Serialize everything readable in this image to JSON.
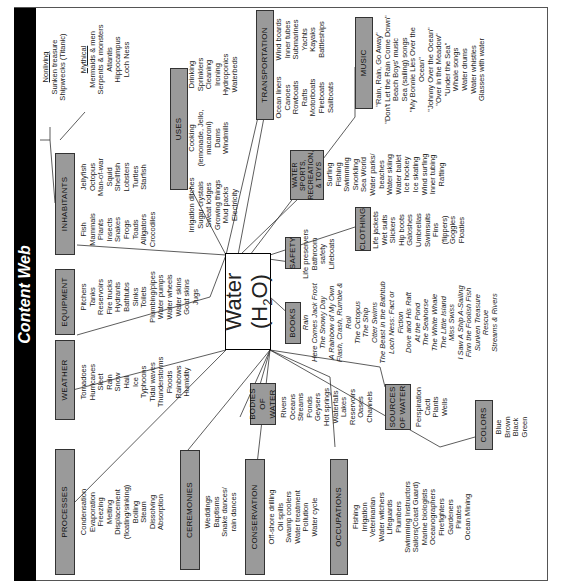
{
  "title": "Content Web",
  "center": {
    "label": "Water (H",
    "sub": "2",
    "tail": "O)"
  },
  "categories": {
    "processes": {
      "label": "PROCESSES",
      "items": [
        "Condensation",
        "Evaporation",
        "Freezing",
        "Melting",
        "Displacement",
        "(floating/sinking)",
        "Boiling",
        "Steam",
        "Dissolving",
        "Absorption"
      ]
    },
    "weather": {
      "label": "WEATHER",
      "items": [
        "Tornadoes",
        "Hurricanes",
        "Sleet",
        "Rain",
        "Snow",
        "Hail",
        "Ice",
        "Typhoons",
        "Tidal waves",
        "Thunderstorms",
        "Floods",
        "Rainbows",
        "Humidity"
      ]
    },
    "equipment": {
      "label": "EQUIPMENT",
      "items": [
        "Pitchers",
        "Tanks",
        "Reservoirs",
        "Fire trucks",
        "Hydrants",
        "Bathtubs",
        "Sinks",
        "Toilets",
        "Plumbing/pipes",
        "Water pumps",
        "Water wheels",
        "Water skins",
        "Goat skins",
        "Jugs"
      ]
    },
    "inhabitants": {
      "label": "INHABITANTS",
      "col1": [
        "Fish",
        "Mammals",
        "Plants",
        "Insects",
        "Snakes",
        "Frogs",
        "Toads",
        "Alligators",
        "Crocodiles"
      ],
      "col2": [
        "Jellyfish",
        "Octopus",
        "Man-of-war",
        "Squid",
        "Shellfish",
        "Lobsters",
        "Turtles",
        "Starfish"
      ]
    },
    "nonliving": {
      "label": "Nonliving",
      "items": [
        "Sunken treasure",
        "Shipwrecks (Titanic)"
      ]
    },
    "mythical": {
      "label": "Mythical",
      "items": [
        "Mermaids & men",
        "Serpents & monsters",
        "Atlantis",
        "Hippocampus",
        "Loch Ness"
      ]
    },
    "uses": {
      "label": "USES",
      "col1": [
        "Irrigation ditches",
        "Sugar crystals",
        "Sweat lodges",
        "Growing things",
        "Mud packs",
        "Electricity"
      ],
      "col2": [
        "Cooking",
        "(lemonade, Jello,",
        "macaroni)",
        "Dams",
        "Windmills"
      ],
      "col3": [
        "Drinking",
        "Sprinklers",
        "Cleaning",
        "Ironing",
        "Hydroponics",
        "Waterbeds"
      ]
    },
    "transportation": {
      "label": "TRANSPORTATION",
      "col1": [
        "Ocean liners",
        "Canoes",
        "Rowboats",
        "Rafts",
        "Motorboats",
        "Fireboats",
        "Sailboats"
      ],
      "col2": [
        "Wind boards",
        "Inner tubes",
        "Submarines",
        "Yachts",
        "Kayaks",
        "Battleships"
      ]
    },
    "music": {
      "label": "MUSIC",
      "items": [
        "\"Rain, Rain, Go Away\"",
        "\"Don't Let the Rain Come Down\"",
        "Beach Boys' music",
        "Sea (sailing) songs",
        "\"My Bonnie Lies Over the",
        "Ocean\"",
        "\"Johnny Over the Ocean\"",
        "\"Over in the Meadow\"",
        "\"Under the Sea\"",
        "Whale songs",
        "Water drums",
        "Water whistles",
        "Glasses with water"
      ]
    },
    "water_sports": {
      "label": "WATER SPORTS, RECREATION, & TOYS",
      "items": [
        "Surfing",
        "Fishing",
        "Swimming",
        "Snorkling",
        "Sea World",
        "Water parks/",
        "beaches",
        "Water skiing",
        "Water ballet",
        "Ice hockey",
        "Ice skating",
        "Wind surfing",
        "Inner tubing",
        "Rafting"
      ]
    },
    "safety": {
      "label": "SAFETY",
      "items": [
        "Life preservers",
        "Bathroom",
        "safety",
        "Lifeboats"
      ]
    },
    "clothing": {
      "label": "CLOTHING",
      "items": [
        "Life jackets",
        "Wet suits",
        "Slickers",
        "Hip boots",
        "Galoshes",
        "Umbrellas",
        "Swimsuits",
        "Fins",
        "(flippers)",
        "Goggles",
        "Floaties"
      ]
    },
    "books": {
      "label": "BOOKS",
      "items": [
        "Rain",
        "Here Comes Jack Frost",
        "The Snowy Day",
        "A Rainbow of My Own",
        "Flash, Crash, Rumble &",
        "Roll",
        "The Octopus",
        "The Ship",
        "Otter Swims",
        "The Beast in the Bathtub",
        "Loch Ness: Fact or",
        "Fiction",
        "Dove and His Raft",
        "At the Pond",
        "The Seahorse",
        "The White Whale",
        "The Little Island",
        "Miss Swiss",
        "I Saw A Ship A-Sailing",
        "Finn the Foolish Fish",
        "Sunken Treasure",
        "Rescue",
        "Streams & Rivers"
      ]
    },
    "bodies_of_water": {
      "label": "BODIES OF WATER",
      "items": [
        "Rivers",
        "Oceans",
        "Streams",
        "Ponds",
        "Geysers",
        "Hot springs",
        "Waterfalls",
        "Lakes",
        "Reservoirs",
        "Oases",
        "Channels"
      ]
    },
    "sources_of_water": {
      "label": "SOURCES OF WATER",
      "items": [
        "Perspiration",
        "Cacti",
        "Plants",
        "Wells"
      ]
    },
    "colors": {
      "label": "COLORS",
      "items": [
        "Blue",
        "Brown",
        "Black",
        "Green"
      ]
    },
    "ceremonies": {
      "label": "CEREMONIES",
      "items": [
        "Weddings",
        "Baptisms",
        "Snake dances/",
        "rain dances"
      ]
    },
    "conservation": {
      "label": "CONSERVATION",
      "items": [
        "Off-shore drilling",
        "Oil spills",
        "Swamp coolers",
        "Water treatment",
        "Pollution",
        "Water cycle"
      ]
    },
    "occupations": {
      "label": "OCCUPATIONS",
      "items": [
        "Fishing",
        "Irrigation",
        "Veterinarian",
        "Water witchers",
        "Lifeguards",
        "Plumbers",
        "Swimming Instructors",
        "Sailors(Coast Guard)",
        "Marine biologists",
        "Oceanographers",
        "Firefighters",
        "Gardeners",
        "Pirates",
        "Ocean Mining"
      ]
    }
  }
}
